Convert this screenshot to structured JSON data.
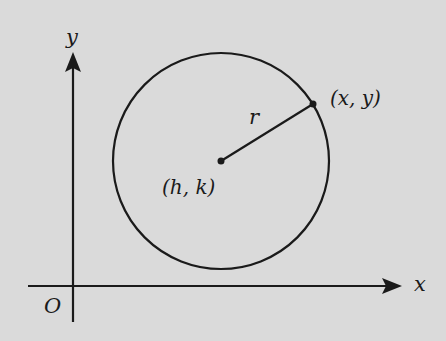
{
  "diagram": {
    "colors": {
      "background": "#dadada",
      "ink": "#1a1a1a"
    },
    "axes": {
      "x_label": "x",
      "y_label": "y",
      "origin_label": "O",
      "origin": {
        "px": 73,
        "py": 286
      }
    },
    "circle": {
      "center_px": {
        "x": 221,
        "y": 161
      },
      "radius_px": 108
    },
    "points": {
      "center": {
        "label": "(h, k)",
        "px": 221,
        "py": 161
      },
      "on_circle": {
        "label": "(x, y)",
        "px": 313,
        "py": 104
      }
    },
    "radius_label": "r"
  }
}
